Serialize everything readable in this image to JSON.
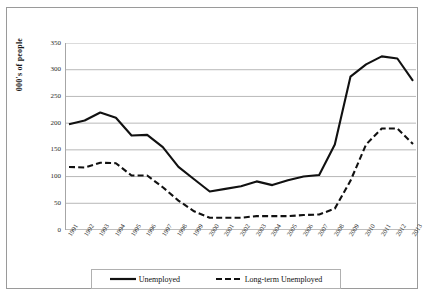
{
  "chart_data": {
    "type": "line",
    "title": "",
    "subtitle": "",
    "xlabel": "",
    "ylabel": "000's of people",
    "ylim": [
      0,
      350
    ],
    "ytick_step": 50,
    "yticks": [
      "350",
      "300",
      "250",
      "200",
      "150",
      "100",
      "50",
      "0"
    ],
    "grid": true,
    "grid_axis": "y",
    "legend_position": "bottom",
    "categories": [
      "1991",
      "1992",
      "1993",
      "1994",
      "1995",
      "1996",
      "1997",
      "1998",
      "1999",
      "2000",
      "2001",
      "2002",
      "2003",
      "2004",
      "2005",
      "2006",
      "2007",
      "2008",
      "2009",
      "2010",
      "2011",
      "2012",
      "2013"
    ],
    "series": [
      {
        "name": "Unemployed",
        "style": "solid",
        "color": "#111111",
        "values": [
          198,
          205,
          220,
          210,
          177,
          178,
          155,
          118,
          95,
          72,
          77,
          82,
          91,
          84,
          93,
          100,
          103,
          160,
          287,
          310,
          325,
          321,
          279
        ]
      },
      {
        "name": "Long-term Unemployed",
        "style": "dashed",
        "color": "#111111",
        "values": [
          118,
          117,
          126,
          125,
          102,
          102,
          80,
          55,
          35,
          23,
          23,
          23,
          26,
          26,
          26,
          28,
          29,
          40,
          92,
          160,
          190,
          190,
          161
        ]
      }
    ]
  },
  "legend": {
    "items": [
      {
        "label": "Unemployed",
        "style": "solid"
      },
      {
        "label": "Long-term Unemployed",
        "style": "dashed"
      }
    ]
  },
  "colors": {
    "line": "#111111",
    "grid": "#a6a6a6",
    "axis": "#a6a6a6",
    "frame": "#9a9a9a",
    "background": "#ffffff",
    "text": "#2b2b2b"
  }
}
